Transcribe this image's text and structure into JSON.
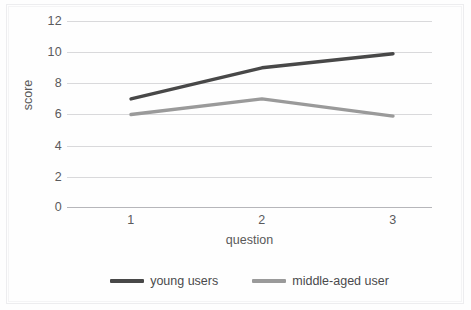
{
  "chart_data": {
    "type": "line",
    "title": "",
    "subtitle": "",
    "xlabel": "question",
    "ylabel": "score",
    "categories": [
      "1",
      "2",
      "3"
    ],
    "x": [
      1,
      2,
      3
    ],
    "xlim": [
      0.5,
      3.5
    ],
    "ylim": [
      0,
      12
    ],
    "yticks": [
      0,
      2,
      4,
      6,
      8,
      10,
      12
    ],
    "xticks": [
      "1",
      "2",
      "3"
    ],
    "grid": true,
    "grid_axis": "y",
    "legend_position": "bottom",
    "series": [
      {
        "name": "young users",
        "values": [
          7,
          9,
          9.9
        ],
        "color": "#484848"
      },
      {
        "name": "middle-aged user",
        "values": [
          6,
          7,
          5.9
        ],
        "color": "#9a9a9a"
      }
    ]
  },
  "axes": {
    "ylabel": "score",
    "xlabel": "question",
    "ytick_labels": [
      "12",
      "10",
      "8",
      "6",
      "4",
      "2",
      "0"
    ],
    "xtick_labels": [
      "1",
      "2",
      "3"
    ]
  },
  "legend": {
    "items": [
      {
        "label": "young users",
        "color": "#484848"
      },
      {
        "label": "middle-aged user",
        "color": "#9a9a9a"
      }
    ]
  },
  "colors": {
    "young_users": "#484848",
    "middle_aged_user": "#9a9a9a",
    "gridline": "#d9d9db",
    "axis": "#b6b6ba",
    "tick_text": "#5a5a5c",
    "background": "#fefefe"
  }
}
